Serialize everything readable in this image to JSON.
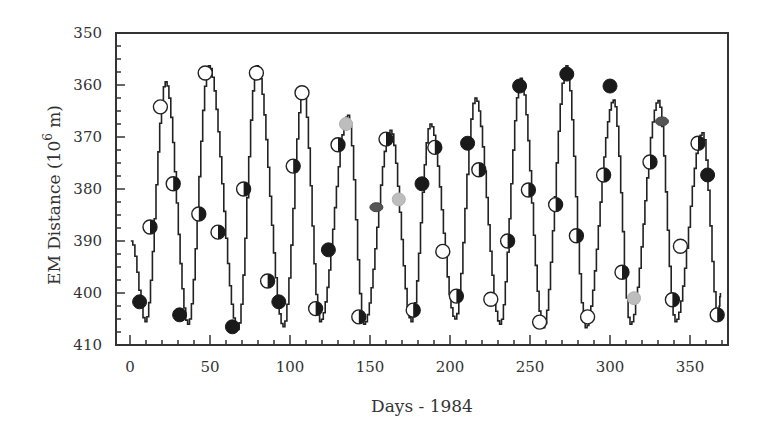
{
  "chart_data": {
    "type": "line",
    "title": "",
    "xlabel": "Days - 1984",
    "ylabel": "EM Distance (10^6 m)",
    "ylabel_parts": {
      "main": "EM Distance (10",
      "sup": "6",
      "unit": " m)"
    },
    "xlim": [
      -8,
      372
    ],
    "ylim": [
      410,
      350
    ],
    "y_inverted": true,
    "grid": false,
    "legend": null,
    "x_ticks": [
      0,
      50,
      100,
      150,
      200,
      250,
      300,
      350
    ],
    "y_ticks": [
      350,
      360,
      370,
      380,
      390,
      400,
      410
    ],
    "x_minor_step": 10,
    "y_minor_step": 2.5,
    "series": [
      {
        "name": "model-curve",
        "style": "stepped-line",
        "color": "#222222",
        "extrema": [
          [
            0.5,
            390.0
          ],
          [
            9.4,
            405.5
          ],
          [
            22.0,
            359.4
          ],
          [
            36.0,
            406.0
          ],
          [
            49.0,
            356.3
          ],
          [
            67.0,
            407.0
          ],
          [
            79.0,
            356.3
          ],
          [
            95.6,
            406.5
          ],
          [
            108.0,
            361.0
          ],
          [
            118.5,
            405.5
          ],
          [
            136.0,
            365.8
          ],
          [
            146.0,
            406.0
          ],
          [
            162.5,
            368.7
          ],
          [
            175.6,
            405.5
          ],
          [
            187.5,
            367.5
          ],
          [
            203.0,
            405.0
          ],
          [
            215.6,
            362.5
          ],
          [
            231.0,
            406.0
          ],
          [
            244.0,
            358.7
          ],
          [
            258.0,
            406.7
          ],
          [
            272.5,
            356.3
          ],
          [
            284.5,
            406.7
          ],
          [
            302.0,
            362.9
          ],
          [
            312.5,
            406.0
          ],
          [
            330.0,
            363.0
          ],
          [
            340.6,
            405.5
          ],
          [
            357.5,
            369.2
          ],
          [
            367.5,
            405.0
          ],
          [
            369.0,
            400.0
          ]
        ]
      },
      {
        "name": "observations",
        "style": "markers",
        "marker_types": {
          "filled": "#1a1a1a",
          "open": "#ffffff",
          "half": "half-filled",
          "grey": "#b8b8b8",
          "dark": "#555555"
        },
        "points": [
          {
            "x": 6,
            "y": 401.7,
            "m": "filled"
          },
          {
            "x": 12.5,
            "y": 387.3,
            "m": "half"
          },
          {
            "x": 19,
            "y": 364.2,
            "m": "open"
          },
          {
            "x": 27,
            "y": 379.0,
            "m": "half"
          },
          {
            "x": 31,
            "y": 404.2,
            "m": "filled"
          },
          {
            "x": 43,
            "y": 384.8,
            "m": "half"
          },
          {
            "x": 47,
            "y": 357.7,
            "m": "open"
          },
          {
            "x": 55,
            "y": 388.3,
            "m": "half"
          },
          {
            "x": 64,
            "y": 406.5,
            "m": "filled"
          },
          {
            "x": 71,
            "y": 380.0,
            "m": "half"
          },
          {
            "x": 79,
            "y": 357.7,
            "m": "open"
          },
          {
            "x": 86,
            "y": 397.7,
            "m": "half"
          },
          {
            "x": 93,
            "y": 401.7,
            "m": "filled"
          },
          {
            "x": 102,
            "y": 375.6,
            "m": "half"
          },
          {
            "x": 107.5,
            "y": 361.5,
            "m": "open"
          },
          {
            "x": 116,
            "y": 403.0,
            "m": "half"
          },
          {
            "x": 124,
            "y": 391.7,
            "m": "filled"
          },
          {
            "x": 130,
            "y": 371.5,
            "m": "half"
          },
          {
            "x": 135,
            "y": 367.5,
            "m": "grey"
          },
          {
            "x": 143,
            "y": 404.6,
            "m": "half"
          },
          {
            "x": 154,
            "y": 383.5,
            "m": "dark"
          },
          {
            "x": 160,
            "y": 370.4,
            "m": "half"
          },
          {
            "x": 168,
            "y": 382.0,
            "m": "grey"
          },
          {
            "x": 177,
            "y": 403.3,
            "m": "half"
          },
          {
            "x": 182.5,
            "y": 379.0,
            "m": "filled"
          },
          {
            "x": 190.5,
            "y": 372.0,
            "m": "half"
          },
          {
            "x": 195.5,
            "y": 392.0,
            "m": "open"
          },
          {
            "x": 204,
            "y": 400.6,
            "m": "half"
          },
          {
            "x": 211,
            "y": 371.2,
            "m": "filled"
          },
          {
            "x": 218,
            "y": 376.3,
            "m": "half"
          },
          {
            "x": 225.5,
            "y": 401.2,
            "m": "open"
          },
          {
            "x": 236,
            "y": 390.0,
            "m": "half"
          },
          {
            "x": 243.5,
            "y": 360.2,
            "m": "filled"
          },
          {
            "x": 249,
            "y": 380.2,
            "m": "half"
          },
          {
            "x": 256,
            "y": 405.6,
            "m": "open"
          },
          {
            "x": 266,
            "y": 383.0,
            "m": "half"
          },
          {
            "x": 273,
            "y": 357.9,
            "m": "filled"
          },
          {
            "x": 279,
            "y": 389.0,
            "m": "half"
          },
          {
            "x": 286,
            "y": 404.6,
            "m": "open"
          },
          {
            "x": 296,
            "y": 377.3,
            "m": "half"
          },
          {
            "x": 300,
            "y": 360.2,
            "m": "filled"
          },
          {
            "x": 307.5,
            "y": 396.0,
            "m": "half"
          },
          {
            "x": 315,
            "y": 401.0,
            "m": "grey"
          },
          {
            "x": 325,
            "y": 374.8,
            "m": "half"
          },
          {
            "x": 332.5,
            "y": 367.0,
            "m": "dark"
          },
          {
            "x": 339,
            "y": 401.3,
            "m": "half"
          },
          {
            "x": 344,
            "y": 391.0,
            "m": "open"
          },
          {
            "x": 355,
            "y": 371.2,
            "m": "half"
          },
          {
            "x": 361,
            "y": 377.3,
            "m": "filled"
          },
          {
            "x": 367,
            "y": 404.2,
            "m": "half"
          }
        ]
      }
    ]
  },
  "layout": {
    "plot_left": 116,
    "plot_top": 33,
    "plot_right": 728,
    "plot_bottom": 345,
    "x0_px": 130,
    "px_per_day": 1.6,
    "y350_px": 33,
    "px_per_unit": 5.2
  }
}
